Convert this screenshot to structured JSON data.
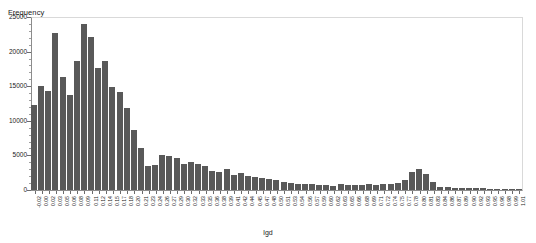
{
  "chart_data": {
    "type": "bar",
    "title": "",
    "subtitle": "",
    "xlabel": "lgd",
    "ylabel": "Frequency",
    "ylim": [
      0,
      25000
    ],
    "xlim": [
      -0.03,
      1.05
    ],
    "grid": false,
    "legend": null,
    "bar_color": "#595959",
    "y_ticks": [
      0,
      5000,
      10000,
      15000,
      20000,
      25000
    ],
    "y_tick_labels": [
      "0",
      "5000",
      "10000",
      "15000",
      "20000",
      "25000"
    ],
    "bin_width": 0.0148,
    "categories": [
      "-0.02",
      "0.00",
      "0.02",
      "0.03",
      "0.05",
      "0.06",
      "0.08",
      "0.09",
      "0.11",
      "0.12",
      "0.14",
      "0.15",
      "0.17",
      "0.18",
      "0.20",
      "0.21",
      "0.23",
      "0.24",
      "0.26",
      "0.27",
      "0.29",
      "0.30",
      "0.32",
      "0.33",
      "0.35",
      "0.36",
      "0.38",
      "0.39",
      "0.41",
      "0.42",
      "0.44",
      "0.45",
      "0.47",
      "0.48",
      "0.50",
      "0.51",
      "0.53",
      "0.54",
      "0.56",
      "0.57",
      "0.59",
      "0.60",
      "0.62",
      "0.63",
      "0.65",
      "0.66",
      "0.68",
      "0.69",
      "0.71",
      "0.72",
      "0.74",
      "0.75",
      "0.77",
      "0.78",
      "0.80",
      "0.81",
      "0.83",
      "0.84",
      "0.86",
      "0.87",
      "0.89",
      "0.90",
      "0.92",
      "0.93",
      "0.95",
      "0.96",
      "0.98",
      "0.99",
      "1.01"
    ],
    "values": [
      12300,
      15000,
      14300,
      22700,
      16300,
      13700,
      18700,
      24000,
      22100,
      17600,
      18700,
      14900,
      14200,
      11800,
      8700,
      6100,
      3500,
      3600,
      5000,
      4900,
      4600,
      3700,
      4100,
      3700,
      3400,
      2800,
      2600,
      3100,
      2100,
      2500,
      2000,
      1900,
      1700,
      1600,
      1500,
      1200,
      1000,
      900,
      800,
      800,
      700,
      700,
      650,
      800,
      700,
      750,
      700,
      800,
      750,
      800,
      900,
      1000,
      1500,
      2600,
      3000,
      2300,
      1100,
      500,
      400,
      300,
      280,
      250,
      230,
      220,
      200,
      190,
      180,
      170,
      150
    ]
  }
}
